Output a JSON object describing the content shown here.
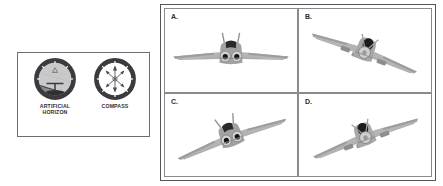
{
  "instrument_panel": {
    "gauges": [
      {
        "id": "artificial-horizon",
        "label": "ARTIFICIAL HORIZON",
        "label_line1": "ARTIFICIAL",
        "label_line2": "HORIZON",
        "bezel_color": "#3a3a3f",
        "sky_color": "#c9c9c9",
        "ground_color": "#8d8d8d",
        "horizon_tilt_deg": -18,
        "bank_indicator": "triangle-top"
      },
      {
        "id": "compass",
        "label": "COMPASS",
        "bezel_color": "#3a3a3f",
        "dial_color": "#ffffff",
        "needle_color": "#4a4a4f",
        "cardinal_marks": [
          "N",
          "E",
          "S",
          "W"
        ]
      }
    ]
  },
  "options": {
    "items": [
      {
        "letter": "A.",
        "aircraft": "jet-twin-engine",
        "attitude": "wings-level-head-on",
        "bank_deg": 0,
        "pitch": "level",
        "body_color": "#9a9a9a",
        "wing_color": "#b4b4b4",
        "canopy_color": "#2a2a2e"
      },
      {
        "letter": "B.",
        "aircraft": "propeller-single-engine",
        "attitude": "banked-right-descending",
        "bank_deg": -22,
        "pitch": "descending",
        "body_color": "#9a9a9a",
        "wing_color": "#b4b4b4",
        "canopy_color": "#2a2a2e"
      },
      {
        "letter": "C.",
        "aircraft": "jet-twin-engine",
        "attitude": "banked-right-climbing",
        "bank_deg": 22,
        "pitch": "climbing",
        "body_color": "#9a9a9a",
        "wing_color": "#b4b4b4",
        "canopy_color": "#2a2a2e"
      },
      {
        "letter": "D.",
        "aircraft": "propeller-single-engine",
        "attitude": "banked-right-climbing",
        "bank_deg": 22,
        "pitch": "climbing",
        "body_color": "#9a9a9a",
        "wing_color": "#b4b4b4",
        "canopy_color": "#2a2a2e"
      }
    ]
  }
}
